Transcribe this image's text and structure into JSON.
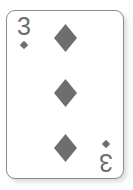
{
  "card": {
    "rank": "3",
    "suit_name": "diamonds",
    "suit_symbol": "♦",
    "pip_count": 3,
    "face_color": "#ffffff",
    "ink_color": "#6e6e6e",
    "border_color": "#8d8d8d",
    "shadow_color": "#bdbdbd",
    "corner_top_left": {
      "rank": "3",
      "suit_symbol": "♦"
    },
    "corner_bottom_right": {
      "rank": "3",
      "suit_symbol": "♦"
    },
    "pips": [
      {
        "index": "1",
        "suit_symbol": "♦",
        "position": "top"
      },
      {
        "index": "2",
        "suit_symbol": "♦",
        "position": "middle"
      },
      {
        "index": "3",
        "suit_symbol": "♦",
        "position": "bottom"
      }
    ]
  }
}
